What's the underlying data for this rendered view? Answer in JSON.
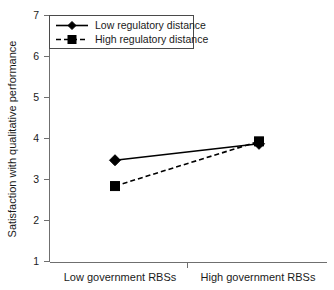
{
  "chart_data": {
    "type": "line",
    "title": "",
    "subtitle": "",
    "xlabel": "",
    "ylabel": "Satisfaction with qualitative performance",
    "categories": [
      "Low government RBSs",
      "High government RBSs"
    ],
    "ylim": [
      1,
      7
    ],
    "yticks": [
      1,
      2,
      3,
      4,
      5,
      6,
      7
    ],
    "ytick_labels": [
      "1",
      "2",
      "3",
      "4",
      "5",
      "6",
      "7"
    ],
    "grid": false,
    "legend_position": "top-left",
    "series": [
      {
        "name": "Low regulatory distance",
        "values": [
          3.47,
          3.87
        ],
        "line_style": "solid",
        "marker": "diamond",
        "color": "#000000"
      },
      {
        "name": "High regulatory distance",
        "values": [
          2.84,
          3.93
        ],
        "line_style": "dashed",
        "marker": "square",
        "color": "#000000"
      }
    ]
  },
  "axes": {
    "y_title": "Satisfaction with qualitative performance",
    "y_tick_1": "1",
    "y_tick_2": "2",
    "y_tick_3": "3",
    "y_tick_4": "4",
    "y_tick_5": "5",
    "y_tick_6": "6",
    "y_tick_7": "7",
    "x_label_left": "Low government RBSs",
    "x_label_right": "High government RBSs"
  },
  "legend": {
    "entry_1": "Low regulatory distance",
    "entry_2": "High regulatory distance"
  },
  "colors": {
    "series": "#000000",
    "axis": "#6f6f6f",
    "text": "#1a1a1a",
    "legend_border": "#4a4a4a",
    "background": "#ffffff"
  }
}
